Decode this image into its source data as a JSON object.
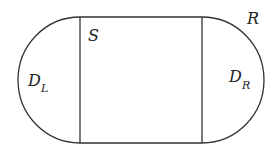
{
  "diagram": {
    "shape": "stadium region R composed of left half-disk D_L, central rectangle S, right half-disk D_R",
    "labels": {
      "S": "S",
      "R": "R",
      "DL_main": "D",
      "DL_sub": "L",
      "DR_main": "D",
      "DR_sub": "R"
    },
    "stroke_color": "#333333"
  }
}
